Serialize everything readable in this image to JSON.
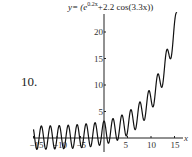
{
  "problem_number": "10.",
  "chart_data": {
    "type": "line",
    "function": "exp(0.2*x)+2.2*cos(3.3*x)",
    "xlabel": "x",
    "ylabel": "",
    "xlim": [
      -15,
      15.5
    ],
    "ylim": [
      -3,
      24
    ],
    "x_ticks": [
      -15,
      -10,
      -5,
      5,
      10,
      15
    ],
    "y_ticks": [
      5,
      10,
      15,
      20
    ],
    "grid": false,
    "legend": "none"
  },
  "labels": {
    "title_prefix": "y= (e",
    "title_exp": "0.2x",
    "title_suffix": "+2.2 cos(3.3x))",
    "x_axis": "x",
    "xt": [
      "−15",
      "−10",
      "−5",
      "5",
      "10",
      "15"
    ],
    "yt": [
      "5",
      "10",
      "15",
      "20"
    ]
  }
}
